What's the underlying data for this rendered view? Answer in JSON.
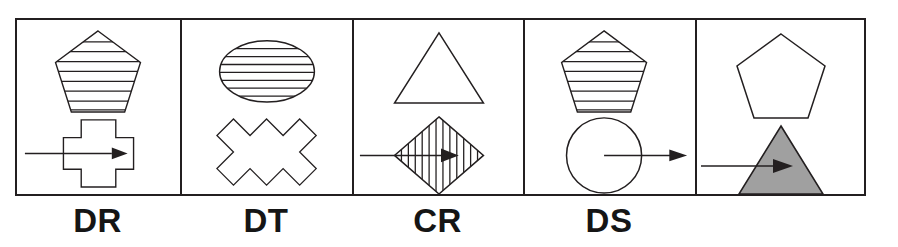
{
  "figure": {
    "type": "shape-condition-panels",
    "panel_count": 5,
    "colors": {
      "stroke": "#231f20",
      "background": "#ffffff",
      "gray_fill": "#a0a0a0",
      "label_text": "#151515"
    },
    "panels": [
      {
        "id": "panel-dr",
        "label": "DR",
        "width_px": 165,
        "top_shape": {
          "name": "pentagon",
          "fill": "striped-horizontal",
          "stripe_count": 8,
          "shape_label": "striped pentagon"
        },
        "bottom_shape": {
          "name": "cross",
          "fill": "none",
          "shape_label": "outline plus-cross"
        },
        "arrow": {
          "present": true,
          "direction": "right",
          "style": "enters-shape",
          "arrow_label": "rightward arrow ending inside the cross"
        }
      },
      {
        "id": "panel-dt",
        "label": "DT",
        "width_px": 172,
        "top_shape": {
          "name": "ellipse",
          "fill": "striped-horizontal",
          "stripe_count": 7,
          "shape_label": "striped ellipse"
        },
        "bottom_shape": {
          "name": "x-cross",
          "fill": "none",
          "shape_label": "outline rotated cross"
        },
        "arrow": {
          "present": false,
          "direction": "",
          "style": "none",
          "arrow_label": "no arrow"
        }
      },
      {
        "id": "panel-cr",
        "label": "CR",
        "width_px": 171,
        "top_shape": {
          "name": "triangle",
          "fill": "none",
          "stripe_count": 0,
          "shape_label": "outline triangle"
        },
        "bottom_shape": {
          "name": "diamond",
          "fill": "striped-vertical",
          "stripe_count": 11,
          "shape_label": "vertically striped diamond"
        },
        "arrow": {
          "present": true,
          "direction": "right",
          "style": "through-shape",
          "arrow_label": "rightward arrow through the diamond"
        }
      },
      {
        "id": "panel-ds",
        "label": "DS",
        "width_px": 172,
        "top_shape": {
          "name": "pentagon",
          "fill": "striped-horizontal",
          "stripe_count": 8,
          "shape_label": "striped pentagon"
        },
        "bottom_shape": {
          "name": "circle",
          "fill": "none",
          "shape_label": "outline circle"
        },
        "arrow": {
          "present": true,
          "direction": "right",
          "style": "exits-shape",
          "arrow_label": "rightward arrow from circle centre pointing outward"
        }
      },
      {
        "id": "panel-unlabeled",
        "label": "",
        "width_px": 167,
        "top_shape": {
          "name": "pentagon",
          "fill": "none",
          "stripe_count": 0,
          "shape_label": "outline pentagon"
        },
        "bottom_shape": {
          "name": "triangle",
          "fill": "solid-gray",
          "shape_label": "gray filled triangle"
        },
        "arrow": {
          "present": true,
          "direction": "right",
          "style": "enters-shape",
          "arrow_label": "rightward arrow ending inside the gray triangle"
        }
      }
    ]
  }
}
